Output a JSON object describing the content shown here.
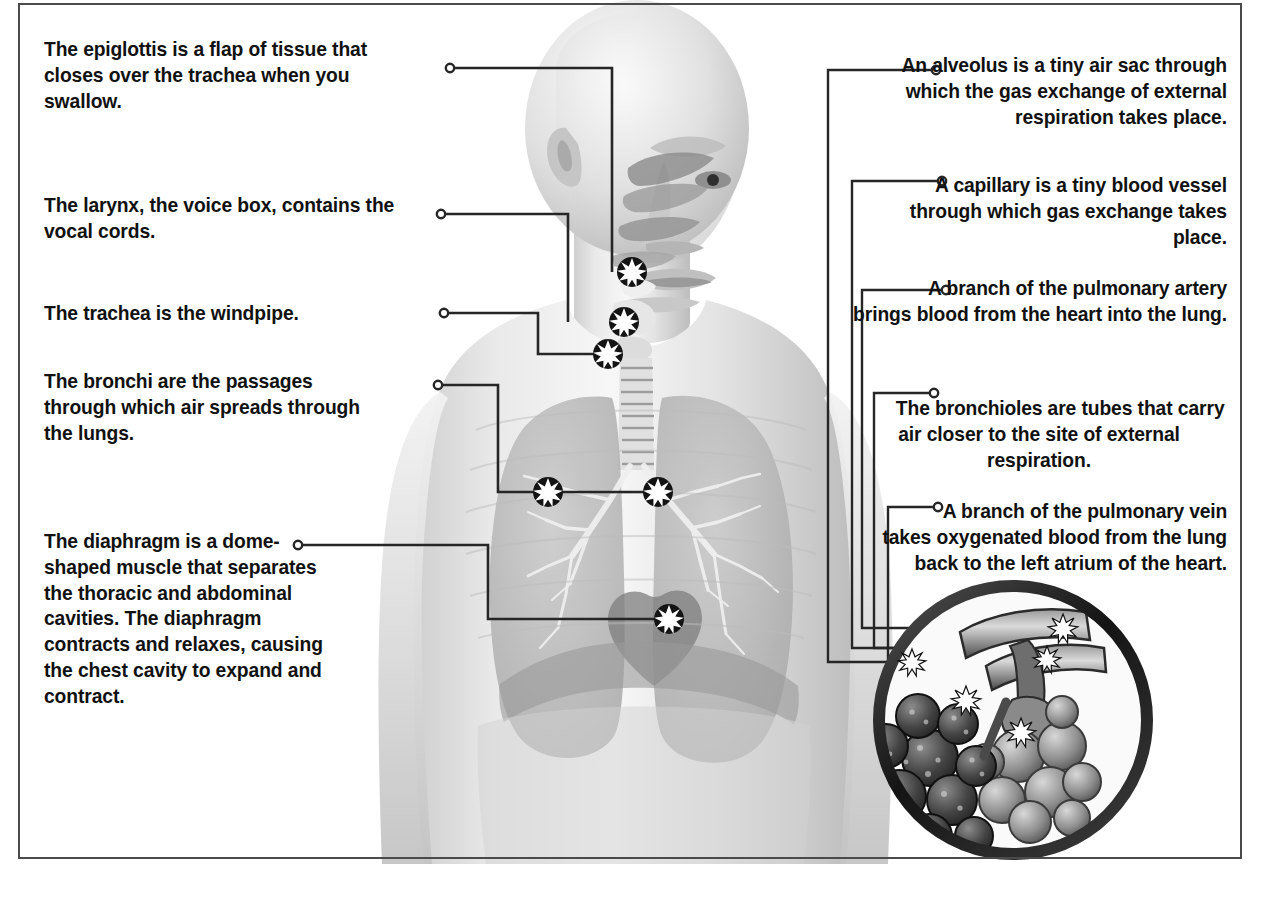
{
  "meta": {
    "figure_kind": "labeled anatomical diagram",
    "border_color": "#4a4a4a",
    "text_color": "#111111",
    "marker_style": "white starburst with black outline",
    "leader_endpoint_style": "small open circle"
  },
  "illustration": {
    "subject": "human head, neck and upper torso, front view, grayscale airbrush rendering",
    "visible_structures": [
      "nasal cavity",
      "oral cavity",
      "epiglottis",
      "larynx",
      "trachea",
      "left lung",
      "right lung",
      "bronchial tree",
      "heart",
      "diaphragm",
      "rib cage outline",
      "shoulders and arms"
    ],
    "inset": {
      "name": "alveoli-detail-inset",
      "shape": "circle",
      "contents": "cluster of alveoli sacs with bronchiole, pulmonary artery and pulmonary vein branches",
      "marker_count": 5
    }
  },
  "labels_left": [
    {
      "id": "epiglottis",
      "term": "epiglottis",
      "before": "The ",
      "after": " is a flap of tissue that closes over the trachea when you swallow."
    },
    {
      "id": "larynx",
      "term": "larynx",
      "before": "The ",
      "after": ", the voice box, contains the vocal cords."
    },
    {
      "id": "trachea",
      "term": "trachea",
      "before": "The ",
      "after": " is the windpipe."
    },
    {
      "id": "bronchi",
      "term": "bronchi",
      "before": "The ",
      "after": " are the passages through which air spreads through the lungs."
    },
    {
      "id": "diaphragm",
      "term": "diaphragm",
      "before": "The ",
      "after": " is a dome-shaped muscle that separates the thoracic and abdominal cavities. The diaphragm contracts and relaxes, causing the chest cavity to expand and contract."
    }
  ],
  "labels_right": [
    {
      "id": "alveolus",
      "term": "alveolus",
      "before": "An ",
      "after": " is a tiny air sac through which the gas exchange of external respiration takes place."
    },
    {
      "id": "capillary",
      "term": "capillary",
      "before": "A ",
      "after": " is a tiny blood vessel through which gas exchange takes place."
    },
    {
      "id": "pulmonary-artery",
      "term": "pulmonary artery",
      "before": "A branch of the ",
      "after": " brings blood from the heart into the lung."
    },
    {
      "id": "bronchioles",
      "term": "bronchioles",
      "before": "The ",
      "after": " are tubes that carry air closer to the site of external respiration."
    },
    {
      "id": "pulmonary-vein",
      "term": "pulmonary vein",
      "before": "A branch of the ",
      "after": " takes oxygenated blood from the lung back to the left atrium of the heart."
    }
  ]
}
